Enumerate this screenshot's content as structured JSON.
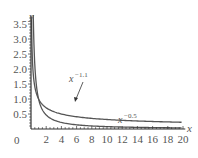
{
  "chart_data": {
    "type": "line",
    "title": "",
    "xlabel": "x",
    "ylabel": "y",
    "xlim": [
      0,
      20
    ],
    "ylim": [
      0,
      3.8
    ],
    "grid": false,
    "legend": "none (inline annotations)",
    "x_ticks": [
      "2",
      "4",
      "6",
      "8",
      "10",
      "12",
      "14",
      "16",
      "18",
      "20"
    ],
    "y_ticks": [
      "0.5",
      "1.0",
      "1.5",
      "2.0",
      "2.5",
      "3.0",
      "3.5"
    ],
    "origin_label": "0",
    "series": [
      {
        "name": "x^-1.1",
        "function": "x^(-1.1)",
        "x": [
          0.3,
          0.5,
          1,
          2,
          4,
          6,
          8,
          10,
          14,
          20
        ],
        "values": [
          3.76,
          2.14,
          1.0,
          0.47,
          0.22,
          0.14,
          0.1,
          0.08,
          0.055,
          0.037
        ]
      },
      {
        "name": "x^-0.5",
        "function": "x^(-0.5)",
        "x": [
          0.1,
          0.2,
          0.5,
          1,
          2,
          4,
          6,
          8,
          10,
          14,
          20
        ],
        "values": [
          3.16,
          2.24,
          1.41,
          1.0,
          0.71,
          0.5,
          0.41,
          0.35,
          0.32,
          0.27,
          0.22
        ]
      }
    ],
    "annotations": [
      {
        "base": "x",
        "exponent": "−1.1",
        "arrow_to_curve": "x^-1.1"
      },
      {
        "base": "x",
        "exponent": "−0.5"
      }
    ]
  },
  "labels": {
    "y_axis": "y",
    "x_axis": "x",
    "origin": "0",
    "anno1_base": "x",
    "anno1_exp": "−1.1",
    "anno2_base": "x",
    "anno2_exp": "−0.5"
  },
  "colors": {
    "curve": "#555555",
    "axis": "#333333",
    "text": "#555555"
  }
}
